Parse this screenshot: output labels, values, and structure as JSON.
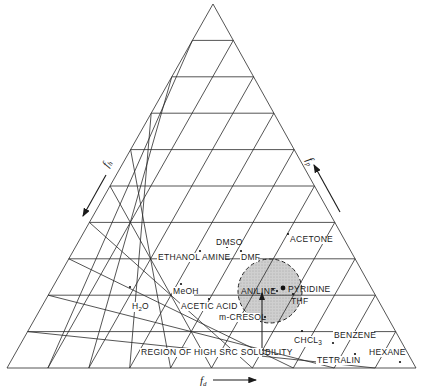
{
  "diagram": {
    "type": "ternary",
    "grid_divisions": 10,
    "axes": {
      "bottom": {
        "label": "f",
        "sub": "d"
      },
      "left": {
        "label": "f",
        "sub": "h"
      },
      "right": {
        "label": "f",
        "sub": "p"
      }
    },
    "region": {
      "label": "REGION OF HIGH SRC SOLUBILITY",
      "fill": "#c8c8c8"
    },
    "solvents": [
      {
        "name": "DMSO",
        "label": "DMSO"
      },
      {
        "name": "ACETONE",
        "label": "ACETONE"
      },
      {
        "name": "ETHANOL AMINE",
        "label": "ETHANOL AMINE"
      },
      {
        "name": "DMF",
        "label": "DMF"
      },
      {
        "name": "MeOH",
        "label": "MeOH"
      },
      {
        "name": "H2O",
        "label": "H",
        "sub": "2",
        "tail": "O"
      },
      {
        "name": "ANILINE",
        "label": "ANILINE"
      },
      {
        "name": "PYRIDINE",
        "label": "PYRIDINE"
      },
      {
        "name": "THF",
        "label": "THF"
      },
      {
        "name": "ACETIC ACID",
        "label": "ACETIC ACID"
      },
      {
        "name": "m-CRESOL",
        "label": "m-CRESOL"
      },
      {
        "name": "CHCL3",
        "label": "CHCL",
        "sub": "3"
      },
      {
        "name": "BENZENE",
        "label": "BENZENE"
      },
      {
        "name": "TETRALIN",
        "label": "TETRALIN"
      },
      {
        "name": "HEXANE",
        "label": "HEXANE"
      }
    ]
  }
}
